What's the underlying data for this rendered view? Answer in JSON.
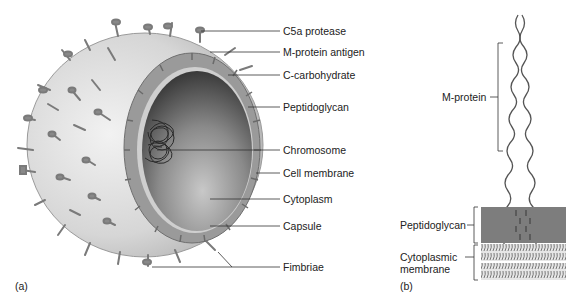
{
  "figure": {
    "panel_a": {
      "label": "(a)",
      "title": "Streptococcus cell cutaway",
      "labels": [
        {
          "id": "c5a",
          "text": "C5a protease",
          "y": 9
        },
        {
          "id": "mprot",
          "text": "M-protein antigen",
          "y": 29
        },
        {
          "id": "ccarb",
          "text": "C-carbohydrate",
          "y": 51
        },
        {
          "id": "pepti",
          "text": "Peptidoglycan",
          "y": 82
        },
        {
          "id": "chrom",
          "text": "Chromosome",
          "y": 127
        },
        {
          "id": "cellmem",
          "text": "Cell membrane",
          "y": 150
        },
        {
          "id": "cyto",
          "text": "Cytoplasm",
          "y": 174
        },
        {
          "id": "caps",
          "text": "Capsule",
          "y": 202
        },
        {
          "id": "fimb",
          "text": "Fimbriae",
          "y": 242
        }
      ]
    },
    "panel_b": {
      "label": "(b)",
      "labels": [
        {
          "id": "mprotein",
          "text": "M-protein"
        },
        {
          "id": "peptidoglycan",
          "text": "Peptidoglycan"
        },
        {
          "id": "cytomem_1",
          "text": "Cytoplasmic"
        },
        {
          "id": "cytomem_2",
          "text": "membrane"
        }
      ]
    },
    "colors": {
      "outer_surface": "#d9d9d9",
      "capsule_ring": "#8f8f8f",
      "cytoplasm_dark": "#3a3a3a",
      "cytoplasm_light": "#bdbdbd",
      "peptidoglycan_block": "#7d7d7d",
      "leader_line": "#333333"
    }
  }
}
